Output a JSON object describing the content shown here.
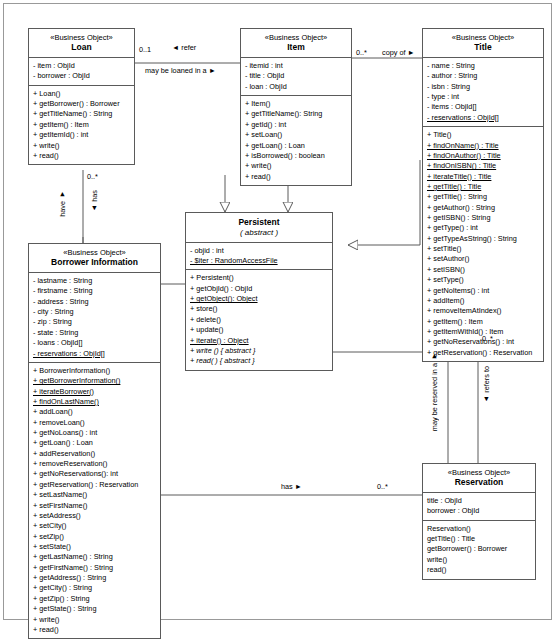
{
  "diagram": {
    "stereotype": "«Business Object»",
    "abstract_marker": "( abstract )"
  },
  "classes": {
    "loan": {
      "stereotype": "«Business Object»",
      "name": "Loan",
      "attributes": [
        "- item : ObjId",
        "- borrower : ObjId"
      ],
      "operations": [
        "+ Loan()",
        "+ getBorrower() : Borrower",
        "+ getTitleName() : String",
        "+ getItem() : Item",
        "+ getItemId() : int",
        "+ write()",
        "+ read()"
      ]
    },
    "item": {
      "stereotype": "«Business Object»",
      "name": "Item",
      "attributes": [
        "- itemid : int",
        "- title : ObjId",
        "- loan : ObjId"
      ],
      "operations": [
        "+ Item()",
        "+ getTitleName(): String",
        "+ getId() : int",
        "+ setLoan()",
        "+ getLoan() : Loan",
        "+ isBorrowed() : boolean",
        "+ write()",
        "+ read()"
      ]
    },
    "title": {
      "stereotype": "«Business Object»",
      "name": "Title",
      "attributes": [
        "- name : String",
        "- author : String",
        "- isbn : String",
        "- type : int",
        "- items : ObjId[]",
        "- reservations : ObjId[]"
      ],
      "operations": [
        "+ Title()",
        "+ findOnName() : Title",
        "+ findOnAuthor() : Title",
        "+ findOnISBN() : Title",
        "+ iterateTitle() : Title",
        "+ getTitle() : Title",
        "+ getTitle() : String",
        "+ getAuthor() : String",
        "+ getISBN() : String",
        "+ getType() : int",
        "+ getTypeAsString() : String",
        "+ setTitle()",
        "+ setAuthor()",
        "+ setISBN()",
        "+ setType()",
        "+ getNoItems() : int",
        "+ addItem()",
        "+ removeItemAtIndex()",
        "+ getItem() : Item",
        "+ getItemWithId() : Item",
        "+ getNoReservations() : int",
        "+ getReservation() : Reservation"
      ],
      "static_attributes": [
        "- reservations : ObjId[]"
      ],
      "static_operations": [
        "+ findOnName() : Title",
        "+ findOnAuthor() : Title",
        "+ findOnISBN() : Title",
        "+ iterateTitle() : Title",
        "+ getTitle() : Title"
      ]
    },
    "persistent": {
      "name": "Persistent",
      "sub": "( abstract )",
      "attributes": [
        "- objid : int",
        "- $iter : RandomAccessFile"
      ],
      "operations": [
        "+ Persistent()",
        "+ getObjId() : ObjId",
        "+ getObject(): Object",
        "+ store()",
        "+ delete()",
        "+ update()",
        "+ iterate() : Object",
        "+ write () { abstract }",
        "+ read( ) { abstract }"
      ],
      "static_attributes": [
        "- $iter : RandomAccessFile"
      ],
      "static_operations": [
        "+ getObject(): Object",
        "+ iterate() : Object"
      ],
      "abstract_operations": [
        "+ write () { abstract }",
        "+ read( ) { abstract }"
      ]
    },
    "borrower": {
      "stereotype": "«Business Object»",
      "name": "Borrower Information",
      "attributes": [
        "- lastname : String",
        "- firstname : String",
        "- address : String",
        "- city : String",
        "- zip : String",
        "- state : String",
        "- loans : ObjId[]",
        "- reservations : ObjId[]"
      ],
      "operations": [
        "+ BorrowerInformation()",
        "+ getBorrowerInformation()",
        "+ iterateBorrower()",
        "+ findOnLastName()",
        "+ addLoan()",
        "+ removeLoan()",
        "+ getNoLoans() : int",
        "+ getLoan() : Loan",
        "+ addReservation()",
        "+ removeReservation()",
        "+ getNoReservations(): int",
        "+ getReservation() : Reservation",
        "+ setLastName()",
        "+ setFirstName()",
        "+ setAddress()",
        "+ setCity()",
        "+ setZip()",
        "+ setState()",
        "+ getLastName() : String",
        "+ getFirstName() : String",
        "+ getAddress() : String",
        "+ getCity() : String",
        "+ getZip() : String",
        "+ getState() : String",
        "+ write()",
        "+ read()"
      ],
      "static_attributes": [
        "- reservations : ObjId[]"
      ],
      "static_operations": [
        "+ getBorrowerInformation()",
        "+ iterateBorrower()",
        "+ findOnLastName()"
      ]
    },
    "reservation": {
      "stereotype": "«Business Object»",
      "name": "Reservation",
      "attributes": [
        "title : ObjId",
        "borrower : ObjId"
      ],
      "operations": [
        "Reservation()",
        "getTitle() : Title",
        "getBorrower() : Borrower",
        "write()",
        "read()"
      ]
    }
  },
  "associations": {
    "loan_item_mult_left": "0..1",
    "loan_item_refer": "◄ refer",
    "loan_item_may_be_loaned": "may be loaned in a ►",
    "item_title_mult": "0..*",
    "item_title_copy_of": "copy of ►",
    "loan_borrower_mult": "0..*",
    "loan_borrower_have": "have ▼",
    "loan_borrower_has": "▲ has",
    "title_reservation_mult": "0..*",
    "title_reservation_may_be_reserved": "may be reserved in a ▼",
    "title_reservation_refers_to": "▲ refers to",
    "borrower_reservation_mult": "0..*",
    "borrower_reservation_has": "has ►"
  }
}
